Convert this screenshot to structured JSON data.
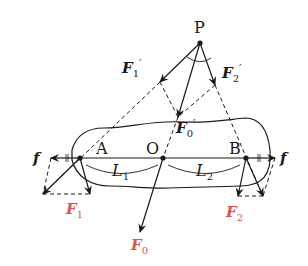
{
  "diagram": {
    "points": {
      "P": {
        "label": "P",
        "x": 200,
        "y": 43
      },
      "A": {
        "label": "A",
        "x": 80,
        "y": 158
      },
      "O": {
        "label": "O",
        "x": 163,
        "y": 158
      },
      "B": {
        "label": "B",
        "x": 246,
        "y": 158
      }
    },
    "vectors": {
      "F1_prime": {
        "symbol": "F",
        "sub": "1",
        "prime": "′",
        "color": "#1a1a1a"
      },
      "F2_prime": {
        "symbol": "F",
        "sub": "2",
        "prime": "′",
        "color": "#1a1a1a"
      },
      "F0_prime": {
        "symbol": "F",
        "sub": "0",
        "prime": "′",
        "color": "#1a1a1a"
      },
      "F1": {
        "symbol": "F",
        "sub": "1",
        "color": "#d9534f"
      },
      "F2": {
        "symbol": "F",
        "sub": "2",
        "color": "#d9534f"
      },
      "F0": {
        "symbol": "F",
        "sub": "0",
        "color": "#d9534f"
      },
      "f_left": {
        "symbol": "f"
      },
      "f_right": {
        "symbol": "f"
      }
    },
    "lengths": {
      "L1": {
        "symbol": "L",
        "sub": "1"
      },
      "L2": {
        "symbol": "L",
        "sub": "2"
      }
    }
  }
}
